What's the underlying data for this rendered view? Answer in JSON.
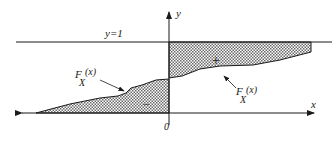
{
  "diagram": {
    "axes": {
      "x_label": "x",
      "y_label": "y",
      "origin_label": "0"
    },
    "reference_line": {
      "label": "y=1"
    },
    "curve_labels": [
      {
        "main": "F",
        "sub": "X",
        "arg": "(x)"
      },
      {
        "main": "F",
        "sub": "X",
        "arg": "(x)"
      }
    ],
    "regions": {
      "positive": {
        "sign": "+"
      },
      "negative": {
        "sign": "−"
      }
    },
    "colors": {
      "line": "#1a1a1a",
      "hatch": "#555555",
      "background": "#ffffff"
    }
  }
}
